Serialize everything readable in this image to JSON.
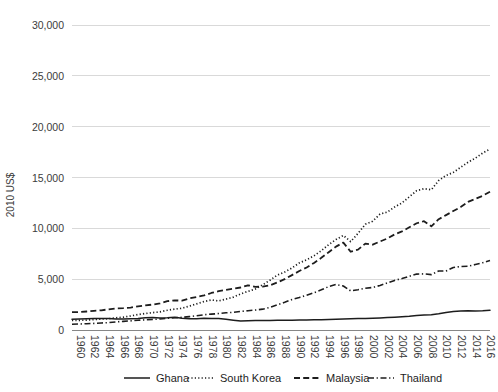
{
  "chart_data": {
    "type": "line",
    "title": "",
    "xlabel": "",
    "ylabel": "2010 US$",
    "ylim": [
      0,
      30000
    ],
    "xlim": [
      1960,
      2017
    ],
    "grid": true,
    "legend_position": "bottom",
    "y_ticks": [
      0,
      5000,
      10000,
      15000,
      20000,
      25000,
      30000
    ],
    "y_tick_labels": [
      "0",
      "5,000",
      "10,000",
      "15,000",
      "20,000",
      "25,000",
      "30,000"
    ],
    "x_tick_labels": [
      "1960",
      "1962",
      "1964",
      "1966",
      "1968",
      "1970",
      "1972",
      "1974",
      "1976",
      "1978",
      "1980",
      "1982",
      "1984",
      "1986",
      "1988",
      "1990",
      "1992",
      "1994",
      "1996",
      "1998",
      "2000",
      "2002",
      "2004",
      "2006",
      "2008",
      "2010",
      "2012",
      "2014",
      "2016"
    ],
    "x": [
      1960,
      1961,
      1962,
      1963,
      1964,
      1965,
      1966,
      1967,
      1968,
      1969,
      1970,
      1971,
      1972,
      1973,
      1974,
      1975,
      1976,
      1977,
      1978,
      1979,
      1980,
      1981,
      1982,
      1983,
      1984,
      1985,
      1986,
      1987,
      1988,
      1989,
      1990,
      1991,
      1992,
      1993,
      1994,
      1995,
      1996,
      1997,
      1998,
      1999,
      2000,
      2001,
      2002,
      2003,
      2004,
      2005,
      2006,
      2007,
      2008,
      2009,
      2010,
      2011,
      2012,
      2013,
      2014,
      2015,
      2016,
      2017
    ],
    "series": [
      {
        "name": "Ghana",
        "style": "solid",
        "color": "#1d1d1d",
        "values": [
          1050,
          1080,
          1100,
          1130,
          1140,
          1120,
          1080,
          1090,
          1110,
          1140,
          1200,
          1230,
          1190,
          1210,
          1260,
          1150,
          1110,
          1110,
          1160,
          1120,
          1120,
          1060,
          970,
          880,
          920,
          940,
          930,
          930,
          950,
          960,
          970,
          990,
          990,
          1000,
          1020,
          1040,
          1060,
          1080,
          1100,
          1130,
          1140,
          1160,
          1190,
          1220,
          1260,
          1300,
          1350,
          1420,
          1480,
          1500,
          1590,
          1730,
          1820,
          1870,
          1890,
          1880,
          1900,
          1940
        ]
      },
      {
        "name": "South Korea",
        "style": "dotted",
        "color": "#1d1d1d",
        "values": [
          940,
          950,
          970,
          1030,
          1080,
          1110,
          1200,
          1260,
          1380,
          1520,
          1620,
          1710,
          1780,
          1940,
          2050,
          2140,
          2350,
          2570,
          2800,
          2960,
          2860,
          3040,
          3230,
          3550,
          3800,
          4030,
          4440,
          4900,
          5400,
          5700,
          6100,
          6600,
          6900,
          7300,
          7800,
          8400,
          8900,
          9300,
          8700,
          9500,
          10400,
          10700,
          11400,
          11600,
          12100,
          12500,
          13100,
          13700,
          13900,
          13800,
          14700,
          15200,
          15500,
          16000,
          16500,
          16900,
          17400,
          17800
        ]
      },
      {
        "name": "Malaysia",
        "style": "dashed",
        "color": "#1d1d1d",
        "values": [
          1750,
          1760,
          1820,
          1890,
          1940,
          2030,
          2120,
          2150,
          2210,
          2320,
          2420,
          2500,
          2620,
          2830,
          2920,
          2880,
          3110,
          3250,
          3400,
          3640,
          3820,
          3950,
          4060,
          4180,
          4400,
          4250,
          4260,
          4400,
          4680,
          5000,
          5400,
          5800,
          6150,
          6600,
          7100,
          7650,
          8200,
          8600,
          7700,
          7900,
          8500,
          8400,
          8700,
          9000,
          9400,
          9700,
          10100,
          10500,
          10700,
          10200,
          10900,
          11300,
          11700,
          12100,
          12600,
          12900,
          13200,
          13600
        ]
      },
      {
        "name": "Thailand",
        "style": "dashdot",
        "color": "#1d1d1d",
        "values": [
          570,
          590,
          620,
          650,
          690,
          730,
          800,
          850,
          900,
          960,
          1000,
          1040,
          1080,
          1160,
          1200,
          1240,
          1320,
          1400,
          1500,
          1560,
          1620,
          1690,
          1740,
          1830,
          1900,
          1960,
          2050,
          2220,
          2470,
          2720,
          3000,
          3200,
          3420,
          3670,
          3950,
          4270,
          4480,
          4330,
          3850,
          3960,
          4100,
          4180,
          4380,
          4630,
          4880,
          5060,
          5280,
          5500,
          5520,
          5450,
          5800,
          5800,
          6150,
          6250,
          6270,
          6440,
          6620,
          6830
        ]
      }
    ],
    "display_scale_note": "series values drawn on 0-30000 axis"
  },
  "legend": {
    "items": [
      {
        "label": "Ghana",
        "style": "solid"
      },
      {
        "label": "South Korea",
        "style": "dotted"
      },
      {
        "label": "Malaysia",
        "style": "dashed"
      },
      {
        "label": "Thailand",
        "style": "dashdot"
      }
    ]
  }
}
